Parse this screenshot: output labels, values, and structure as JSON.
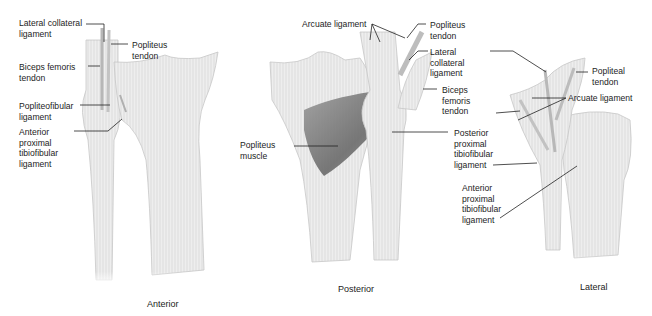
{
  "figure": {
    "views": [
      {
        "name": "Anterior",
        "caption": "Anterior"
      },
      {
        "name": "Posterior",
        "caption": "Posterior"
      },
      {
        "name": "Lateral",
        "caption": "Lateral"
      }
    ],
    "colors": {
      "bone": "#ededed",
      "bone_shadow": "#c9c9c9",
      "muscle": "#6e6e6e",
      "leader": "#222222",
      "text": "#1d1d1d"
    }
  },
  "anterior": {
    "labels": [
      {
        "id": "lcl",
        "text": "Lateral collateral\nligament"
      },
      {
        "id": "popliteus_tendon",
        "text": "Popliteus\ntendon"
      },
      {
        "id": "biceps",
        "text": "Biceps femoris\ntendon"
      },
      {
        "id": "popliteofibular",
        "text": "Popliteofibular\nligament"
      },
      {
        "id": "aptfl",
        "text": "Anterior\nproximal\ntibiofibular\nligament"
      }
    ]
  },
  "posterior": {
    "labels": [
      {
        "id": "arcuate",
        "text": "Arcuate ligament"
      },
      {
        "id": "popliteus_tendon",
        "text": "Popliteus\ntendon"
      },
      {
        "id": "lcl",
        "text": "Lateral\ncollateral\nligament"
      },
      {
        "id": "biceps",
        "text": "Biceps\nfemoris\ntendon"
      },
      {
        "id": "popliteus_muscle",
        "text": "Popliteus\nmuscle"
      },
      {
        "id": "pptfl",
        "text": "Posterior\nproximal\ntibiofibular\nligament"
      }
    ]
  },
  "lateral": {
    "labels": [
      {
        "id": "popliteal_tendon",
        "text": "Popliteal\ntendon"
      },
      {
        "id": "arcuate",
        "text": "Arcuate ligament"
      },
      {
        "id": "aptfl",
        "text": "Anterior\nproximal\ntibiofibular\nligament"
      }
    ]
  }
}
